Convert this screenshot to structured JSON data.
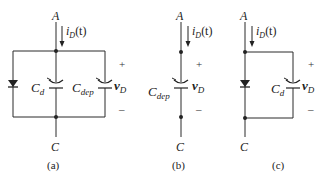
{
  "figure": {
    "panels": [
      {
        "id": "a",
        "caption": "(a)",
        "top_node": "A",
        "bottom_node": "C",
        "current": {
          "sym": "i",
          "sub": "D",
          "arg": "(t)"
        },
        "components": [
          "diode",
          "C_d",
          "C_dep"
        ],
        "cap1": {
          "sym": "C",
          "sub": "d"
        },
        "cap2": {
          "sym": "C",
          "sub": "dep"
        },
        "voltage": {
          "sym": "v",
          "sub": "D",
          "plus": "+",
          "minus": "–"
        }
      },
      {
        "id": "b",
        "caption": "(b)",
        "top_node": "A",
        "bottom_node": "C",
        "current": {
          "sym": "i",
          "sub": "D",
          "arg": "(t)"
        },
        "components": [
          "C_dep"
        ],
        "cap1": {
          "sym": "C",
          "sub": "dep"
        },
        "voltage": {
          "sym": "v",
          "sub": "D",
          "plus": "+",
          "minus": "–"
        }
      },
      {
        "id": "c",
        "caption": "(c)",
        "top_node": "A",
        "bottom_node": "C",
        "current": {
          "sym": "i",
          "sub": "D",
          "arg": "(t)"
        },
        "components": [
          "diode",
          "C_d"
        ],
        "cap1": {
          "sym": "C",
          "sub": "d"
        },
        "voltage": {
          "sym": "v",
          "sub": "D",
          "plus": "+",
          "minus": "–"
        }
      }
    ]
  }
}
